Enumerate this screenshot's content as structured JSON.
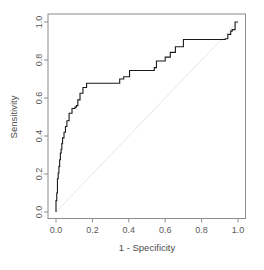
{
  "figure": {
    "name": "roc-curve-plot",
    "background_color": "#ffffff",
    "axis_color": "#8c8c8c",
    "curve_color": "#1a1a1a",
    "reference_line_color": "#e6e6e6",
    "tick_label_color": "#5a5a5a"
  },
  "chart_data": {
    "type": "line",
    "title": "",
    "subtitle": "",
    "xlabel": "1 - Specificity",
    "ylabel": "Sensitivity",
    "xlim": [
      0.0,
      1.0
    ],
    "ylim": [
      0.0,
      1.0
    ],
    "grid": false,
    "legend": null,
    "xticks": [
      0.0,
      0.2,
      0.4,
      0.6,
      0.8,
      1.0
    ],
    "xticklabels": [
      "0.0",
      "0.2",
      "0.4",
      "0.6",
      "0.8",
      "1.0"
    ],
    "yticks": [
      0.0,
      0.2,
      0.4,
      0.6,
      0.8,
      1.0
    ],
    "yticklabels": [
      "0.0",
      "0.2",
      "0.4",
      "0.6",
      "0.8",
      "1.0"
    ],
    "ytick_label_rotation": -90,
    "annotations": [],
    "series": [
      {
        "name": "ROC curve",
        "style": "step",
        "color": "#1a1a1a",
        "linewidth": 1.1,
        "x": [
          0.0,
          0.0,
          0.004,
          0.004,
          0.008,
          0.008,
          0.008,
          0.008,
          0.012,
          0.012,
          0.016,
          0.016,
          0.02,
          0.02,
          0.024,
          0.024,
          0.028,
          0.028,
          0.032,
          0.032,
          0.036,
          0.036,
          0.044,
          0.044,
          0.052,
          0.052,
          0.06,
          0.06,
          0.072,
          0.072,
          0.088,
          0.088,
          0.104,
          0.104,
          0.112,
          0.112,
          0.12,
          0.12,
          0.132,
          0.132,
          0.148,
          0.148,
          0.168,
          0.168,
          0.35,
          0.35,
          0.372,
          0.372,
          0.404,
          0.404,
          0.54,
          0.54,
          0.552,
          0.552,
          0.6,
          0.6,
          0.628,
          0.628,
          0.656,
          0.656,
          0.7,
          0.7,
          0.93,
          0.93,
          0.944,
          0.944,
          0.96,
          0.96,
          0.968,
          0.968,
          0.984,
          0.984,
          1.0
        ],
        "y": [
          0.0,
          0.06,
          0.06,
          0.1,
          0.1,
          0.14,
          0.14,
          0.175,
          0.175,
          0.205,
          0.205,
          0.24,
          0.24,
          0.275,
          0.275,
          0.31,
          0.31,
          0.33,
          0.33,
          0.36,
          0.36,
          0.39,
          0.39,
          0.42,
          0.42,
          0.45,
          0.45,
          0.48,
          0.48,
          0.52,
          0.52,
          0.545,
          0.545,
          0.552,
          0.552,
          0.56,
          0.56,
          0.59,
          0.59,
          0.625,
          0.625,
          0.655,
          0.655,
          0.678,
          0.678,
          0.7,
          0.7,
          0.712,
          0.712,
          0.745,
          0.745,
          0.76,
          0.76,
          0.795,
          0.795,
          0.815,
          0.815,
          0.84,
          0.84,
          0.87,
          0.87,
          0.908,
          0.908,
          0.912,
          0.912,
          0.935,
          0.935,
          0.952,
          0.952,
          0.96,
          0.96,
          1.0,
          1.0
        ]
      },
      {
        "name": "chance reference line",
        "style": "line",
        "color": "#e6e6e6",
        "linewidth": 1.0,
        "x": [
          0.0,
          1.0
        ],
        "y": [
          0.0,
          1.0
        ]
      }
    ]
  }
}
